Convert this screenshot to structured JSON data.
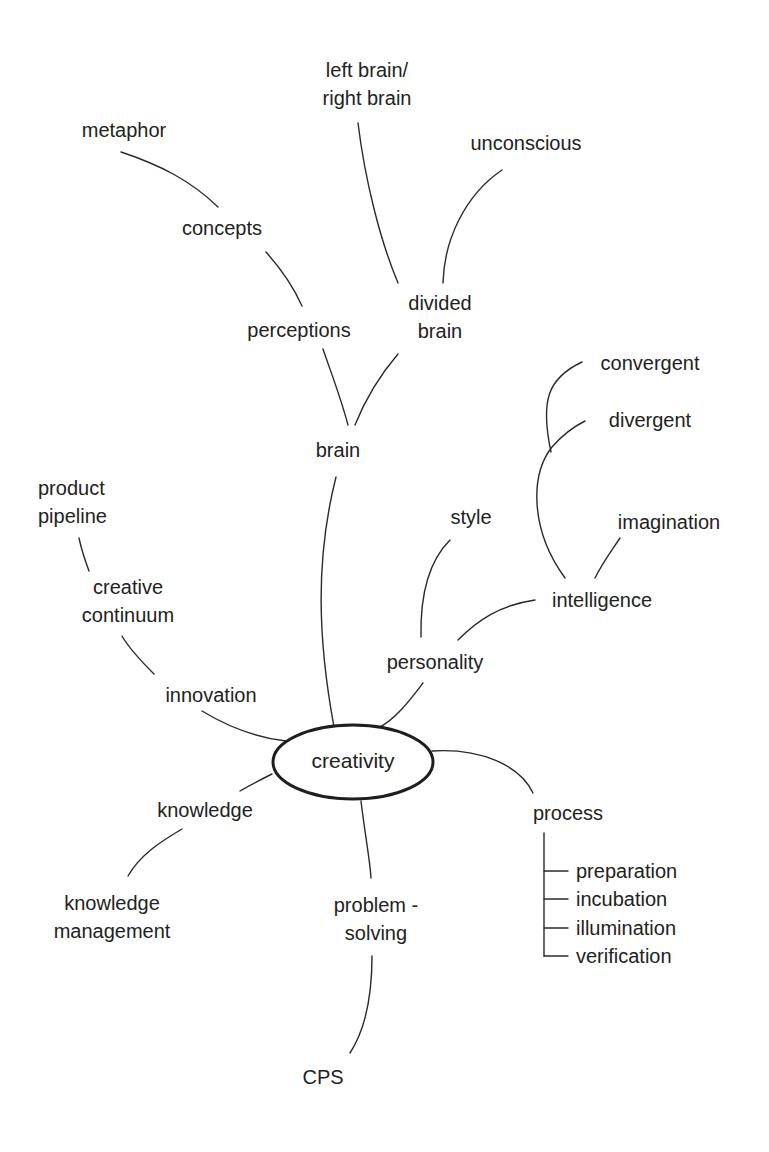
{
  "diagram": {
    "type": "mind-map",
    "center": {
      "label": "creativity"
    },
    "nodes": {
      "brain": "brain",
      "perceptions": "perceptions",
      "concepts": "concepts",
      "metaphor": "metaphor",
      "divided_brain": {
        "line1": "divided",
        "line2": "brain"
      },
      "left_right_brain": {
        "line1": "left brain/",
        "line2": "right brain"
      },
      "unconscious": "unconscious",
      "personality": "personality",
      "style": "style",
      "intelligence": "intelligence",
      "imagination": "imagination",
      "divergent": "divergent",
      "convergent": "convergent",
      "innovation": "innovation",
      "creative_continuum": {
        "line1": "creative",
        "line2": "continuum"
      },
      "product_pipeline": {
        "line1": "product",
        "line2": "pipeline"
      },
      "knowledge": "knowledge",
      "knowledge_management": {
        "line1": "knowledge",
        "line2": "management"
      },
      "problem_solving": {
        "line1": "problem -",
        "line2": "solving"
      },
      "cps": "CPS",
      "process": "process",
      "process_steps": [
        "preparation",
        "incubation",
        "illumination",
        "verification"
      ]
    },
    "edges": [
      [
        "creativity",
        "brain"
      ],
      [
        "brain",
        "perceptions"
      ],
      [
        "brain",
        "divided brain"
      ],
      [
        "perceptions",
        "concepts"
      ],
      [
        "concepts",
        "metaphor"
      ],
      [
        "divided brain",
        "left brain/right brain"
      ],
      [
        "divided brain",
        "unconscious"
      ],
      [
        "creativity",
        "personality"
      ],
      [
        "personality",
        "style"
      ],
      [
        "personality",
        "intelligence"
      ],
      [
        "intelligence",
        "imagination"
      ],
      [
        "intelligence",
        "divergent"
      ],
      [
        "intelligence",
        "convergent"
      ],
      [
        "creativity",
        "innovation"
      ],
      [
        "innovation",
        "creative continuum"
      ],
      [
        "creative continuum",
        "product pipeline"
      ],
      [
        "creativity",
        "knowledge"
      ],
      [
        "knowledge",
        "knowledge management"
      ],
      [
        "creativity",
        "problem-solving"
      ],
      [
        "problem-solving",
        "CPS"
      ],
      [
        "creativity",
        "process"
      ],
      [
        "process",
        "preparation"
      ],
      [
        "process",
        "incubation"
      ],
      [
        "process",
        "illumination"
      ],
      [
        "process",
        "verification"
      ]
    ]
  }
}
